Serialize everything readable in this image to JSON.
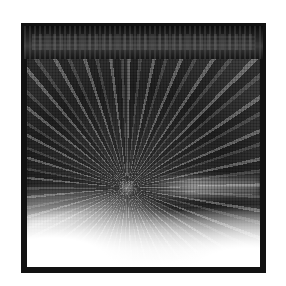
{
  "image": {
    "description": "Halftone black-and-white photograph of a radial light burst inside a thick black frame with a dark header band",
    "header_text": "",
    "colors": {
      "frame": "#111111",
      "header": "#1a1a1a",
      "background": "#ffffff"
    }
  }
}
